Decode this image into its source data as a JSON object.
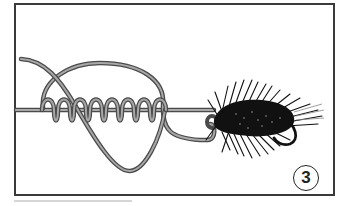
{
  "figure": {
    "step_number": "3",
    "coil_count": 8,
    "colors": {
      "line_outline": "#4a4a4a",
      "line_fill": "#9a9a9a",
      "fly": "#111111",
      "frame": "#3a3a3a",
      "background": "#ffffff"
    }
  }
}
